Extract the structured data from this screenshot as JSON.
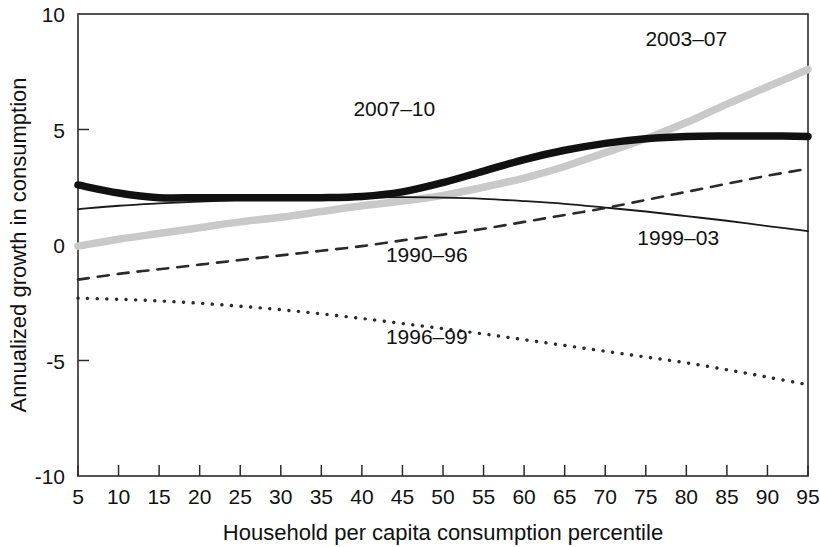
{
  "chart_data": {
    "type": "line",
    "title": "",
    "xlabel": "Household per capita consumption percentile",
    "ylabel": "Annualized growth in consumption",
    "xlim": [
      5,
      95
    ],
    "ylim": [
      -10,
      10
    ],
    "grid": false,
    "legend_position": "inline-annotations",
    "yticks": [
      -10,
      -5,
      0,
      5,
      10
    ],
    "ytick_labels": [
      "-10",
      "-5",
      "0",
      "5",
      "10"
    ],
    "x": [
      5,
      10,
      15,
      20,
      25,
      30,
      35,
      40,
      45,
      50,
      55,
      60,
      65,
      70,
      75,
      80,
      85,
      90,
      95
    ],
    "xtick_labels": [
      "5",
      "10",
      "15",
      "20",
      "25",
      "30",
      "35",
      "40",
      "45",
      "50",
      "55",
      "60",
      "65",
      "70",
      "75",
      "80",
      "85",
      "90",
      "95"
    ],
    "series": [
      {
        "name": "2007-10",
        "label": "2007–10",
        "style": "solid-thick",
        "color": "#111111",
        "width": 7.5,
        "values": [
          2.6,
          2.25,
          2.05,
          2.05,
          2.05,
          2.05,
          2.05,
          2.1,
          2.3,
          2.7,
          3.2,
          3.7,
          4.1,
          4.4,
          4.6,
          4.7,
          4.72,
          4.72,
          4.7
        ],
        "label_x": 44,
        "label_y": 5.6
      },
      {
        "name": "2003-07",
        "label": "2003–07",
        "style": "solid-thick",
        "color": "#c9c9c9",
        "width": 7.5,
        "values": [
          -0.05,
          0.25,
          0.5,
          0.75,
          1.0,
          1.2,
          1.45,
          1.7,
          1.9,
          2.15,
          2.5,
          2.9,
          3.4,
          4.0,
          4.6,
          5.3,
          6.1,
          6.85,
          7.6
        ],
        "label_x": 80,
        "label_y": 8.6
      },
      {
        "name": "1999-03",
        "label": "1999–03",
        "style": "solid-thin",
        "color": "#1a1a1a",
        "width": 1.8,
        "values": [
          1.55,
          1.7,
          1.8,
          1.88,
          1.95,
          2.0,
          2.03,
          2.05,
          2.07,
          2.05,
          2.0,
          1.9,
          1.78,
          1.62,
          1.45,
          1.25,
          1.05,
          0.82,
          0.6
        ],
        "label_x": 79,
        "label_y": 0.0
      },
      {
        "name": "1990-96",
        "label": "1990–96",
        "style": "dashed",
        "color": "#2a2a2a",
        "width": 2.6,
        "values": [
          -1.5,
          -1.25,
          -1.05,
          -0.85,
          -0.65,
          -0.45,
          -0.25,
          -0.05,
          0.2,
          0.45,
          0.7,
          1.0,
          1.3,
          1.6,
          1.95,
          2.3,
          2.65,
          3.0,
          3.3
        ],
        "label_x": 48,
        "label_y": -0.75
      },
      {
        "name": "1996-99",
        "label": "1996–99",
        "style": "dotted",
        "color": "#2a2a2a",
        "width": 3.4,
        "values": [
          -2.3,
          -2.35,
          -2.42,
          -2.52,
          -2.65,
          -2.8,
          -2.98,
          -3.18,
          -3.4,
          -3.62,
          -3.85,
          -4.1,
          -4.35,
          -4.6,
          -4.85,
          -5.1,
          -5.4,
          -5.72,
          -6.05
        ],
        "label_x": 48,
        "label_y": -4.3
      }
    ]
  },
  "axis": {
    "x_title": "Household per capita consumption percentile",
    "y_title": "Annualized growth in consumption"
  }
}
